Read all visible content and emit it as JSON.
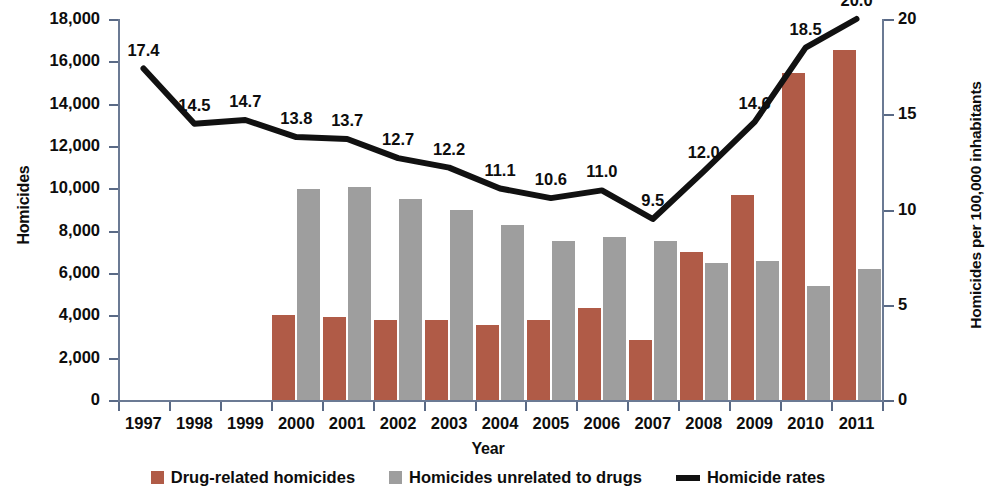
{
  "chart_data": {
    "type": "bar",
    "title": "",
    "xlabel": "Year",
    "ylabel": "Homicides",
    "y2label": "Homicides per 100,000 inhabitants",
    "categories": [
      "1997",
      "1998",
      "1999",
      "2000",
      "2001",
      "2002",
      "2003",
      "2004",
      "2005",
      "2006",
      "2007",
      "2008",
      "2009",
      "2010",
      "2011"
    ],
    "ylim": [
      0,
      18000
    ],
    "y2lim": [
      0,
      20
    ],
    "yticks": [
      "0",
      "2,000",
      "4,000",
      "6,000",
      "8,000",
      "10,000",
      "12,000",
      "14,000",
      "16,000",
      "18,000"
    ],
    "ytick_values": [
      0,
      2000,
      4000,
      6000,
      8000,
      10000,
      12000,
      14000,
      16000,
      18000
    ],
    "y2ticks": [
      "0",
      "5",
      "10",
      "15",
      "20"
    ],
    "y2tick_values": [
      0,
      5,
      10,
      15,
      20
    ],
    "grid": false,
    "legend_position": "bottom",
    "series": [
      {
        "name": "Drug-related homicides",
        "type": "bar",
        "color": "#b05b47",
        "axis": "left",
        "values": [
          null,
          null,
          null,
          4000,
          3900,
          3800,
          3800,
          3550,
          3800,
          4350,
          2850,
          7000,
          9700,
          15450,
          16550
        ]
      },
      {
        "name": "Homicides unrelated to drugs",
        "type": "bar",
        "color": "#9e9e9e",
        "axis": "left",
        "values": [
          null,
          null,
          null,
          9950,
          10050,
          9500,
          9000,
          8250,
          7500,
          7700,
          7500,
          6450,
          6550,
          5400,
          6200
        ]
      },
      {
        "name": "Homicide rates",
        "type": "line",
        "color": "#111111",
        "axis": "right",
        "values": [
          17.4,
          14.5,
          14.7,
          13.8,
          13.7,
          12.7,
          12.2,
          11.1,
          10.6,
          11.0,
          9.5,
          12.0,
          14.6,
          18.5,
          20.0
        ],
        "labels": [
          "17.4",
          "14.5",
          "14.7",
          "13.8",
          "13.7",
          "12.7",
          "12.2",
          "11.1",
          "10.6",
          "11.0",
          "9.5",
          "12.0",
          "14.6",
          "18.5",
          "20.0"
        ]
      }
    ]
  },
  "legend": {
    "items": [
      {
        "label": "Drug-related homicides",
        "marker": "square-red"
      },
      {
        "label": "Homicides unrelated to drugs",
        "marker": "square-gray"
      },
      {
        "label": "Homicide rates",
        "marker": "line-black"
      }
    ]
  }
}
